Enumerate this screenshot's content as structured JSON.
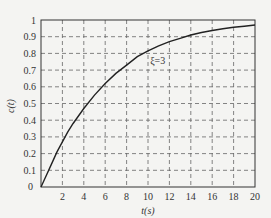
{
  "chart_data": {
    "type": "line",
    "title": "",
    "xlabel": "t(s)",
    "ylabel": "c(t)",
    "xlim": [
      0,
      20
    ],
    "ylim": [
      0,
      1
    ],
    "xticks": [
      2,
      4,
      6,
      8,
      10,
      12,
      14,
      16,
      18,
      20
    ],
    "yticks": [
      0,
      0.1,
      0.2,
      0.3,
      0.4,
      0.5,
      0.6,
      0.7,
      0.8,
      0.9,
      1
    ],
    "ytick_labels": [
      "0",
      "0.1",
      "0.2",
      "0.3",
      "0.4",
      "0.5",
      "0.6",
      "0.7",
      "0.8",
      "0.9",
      "1"
    ],
    "xtick_labels": [
      "2",
      "4",
      "6",
      "8",
      "10",
      "12",
      "14",
      "16",
      "18",
      "20"
    ],
    "origin_label": "0",
    "grid": true,
    "grid_style": "dashed",
    "annotation": {
      "text": "ξ=3",
      "x": 10.2,
      "y": 0.795
    },
    "series": [
      {
        "name": "ξ=3",
        "x": [
          0,
          0.5,
          1,
          1.5,
          2,
          2.5,
          3,
          4,
          5,
          6,
          7,
          8,
          9,
          10,
          11,
          12,
          13,
          14,
          15,
          16,
          17,
          18,
          19,
          20
        ],
        "values": [
          0,
          0.07,
          0.14,
          0.21,
          0.27,
          0.33,
          0.38,
          0.47,
          0.55,
          0.62,
          0.68,
          0.73,
          0.78,
          0.815,
          0.845,
          0.87,
          0.89,
          0.91,
          0.925,
          0.937,
          0.948,
          0.956,
          0.963,
          0.97
        ]
      }
    ]
  }
}
